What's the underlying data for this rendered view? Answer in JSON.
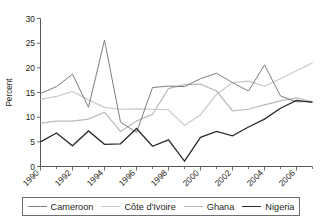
{
  "chart_data": {
    "type": "line",
    "title": "",
    "xlabel": "",
    "ylabel": "Percent",
    "xlim": [
      1990,
      2007
    ],
    "ylim": [
      0,
      30
    ],
    "ytick_labels": [
      "0",
      "5",
      "10",
      "15",
      "20",
      "25",
      "30"
    ],
    "ytick_values": [
      0,
      5,
      10,
      15,
      20,
      25,
      30
    ],
    "xtick_labels": [
      "1990",
      "1992",
      "1994",
      "1996",
      "1998",
      "2000",
      "2002",
      "2004",
      "2006"
    ],
    "xtick_values": [
      1990,
      1992,
      1994,
      1996,
      1998,
      2000,
      2002,
      2004,
      2006
    ],
    "x": [
      1990,
      1991,
      1992,
      1993,
      1994,
      1995,
      1996,
      1997,
      1998,
      1999,
      2000,
      2001,
      2002,
      2003,
      2004,
      2005,
      2006,
      2007
    ],
    "grid": false,
    "legend_position": "bottom",
    "series": [
      {
        "name": "Cameroon",
        "color": "#7d7e80",
        "width": 1.0,
        "values": [
          14.8,
          16.2,
          18.7,
          12.0,
          25.6,
          9.0,
          6.9,
          16.0,
          16.3,
          16.2,
          17.8,
          18.9,
          17.0,
          15.3,
          20.6,
          14.3,
          13.1,
          13.2
        ]
      },
      {
        "name": "Côte d'Ivoire",
        "color": "#c9cacc",
        "width": 1.2,
        "values": [
          13.6,
          14.2,
          15.2,
          13.5,
          12.0,
          11.6,
          11.7,
          11.6,
          11.5,
          8.3,
          10.5,
          14.6,
          17.0,
          17.3,
          16.3,
          17.8,
          19.4,
          21.0
        ]
      },
      {
        "name": "Ghana",
        "color": "#b9babc",
        "width": 1.2,
        "values": [
          8.8,
          9.2,
          9.2,
          9.6,
          11.0,
          7.1,
          9.2,
          10.6,
          15.8,
          16.6,
          16.7,
          15.3,
          11.3,
          11.6,
          12.5,
          13.3,
          13.9,
          13.1
        ]
      },
      {
        "name": "Nigeria",
        "color": "#2b2b2b",
        "width": 1.3,
        "values": [
          5.0,
          6.8,
          4.2,
          7.2,
          4.5,
          4.6,
          7.7,
          4.1,
          5.4,
          1.1,
          5.9,
          7.1,
          6.2,
          8.0,
          9.6,
          11.8,
          13.4,
          13.0
        ]
      }
    ]
  },
  "legend": {
    "entries": [
      {
        "label": "Cameroon"
      },
      {
        "label": "Côte d'Ivoire"
      },
      {
        "label": "Ghana"
      },
      {
        "label": "Nigeria"
      }
    ]
  }
}
